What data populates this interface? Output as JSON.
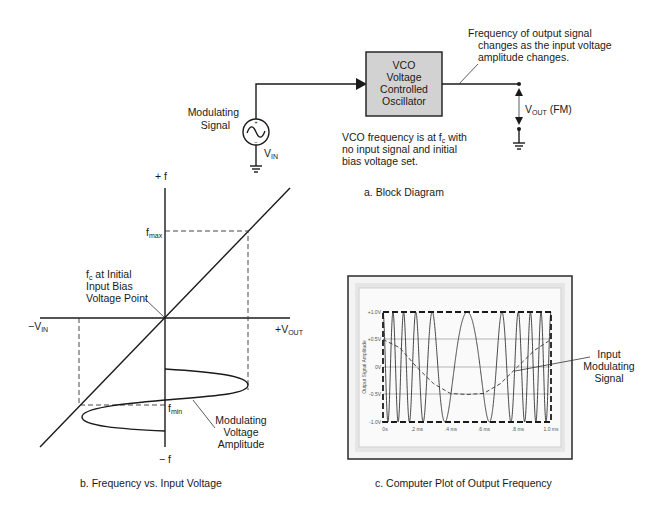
{
  "block_diagram": {
    "caption": "a. Block Diagram",
    "source_label_line1": "Modulating",
    "source_label_line2": "Signal",
    "source_name": "V",
    "source_sub": "IN",
    "vco_lines": [
      "VCO",
      "Voltage",
      "Controlled",
      "Oscillator"
    ],
    "vco_fill": "#d2d2d2",
    "output_name": "V",
    "output_sub": "OUT",
    "output_suffix": " (FM)",
    "note_top": [
      "Frequency of output signal",
      "changes as the input voltage",
      "amplitude changes."
    ],
    "note_bottom_line1_pre": "VCO frequency is at f",
    "note_bottom_line1_sub": "c",
    "note_bottom_line1_post": " with",
    "note_bottom_line2": "no input signal and initial",
    "note_bottom_line3": "bias voltage set."
  },
  "freq_graph": {
    "caption": "b. Frequency vs. Input Voltage",
    "y_pos_label": "+ f",
    "y_neg_label": "− f",
    "x_neg_label": "−V",
    "x_neg_sub": "IN",
    "x_pos_label": "+V",
    "x_pos_sub": "OUT",
    "fmax_label": "f",
    "fmax_sub": "max",
    "fmin_label": "f",
    "fmin_sub": "min",
    "fc_note_pre": "f",
    "fc_note_sub": "c",
    "fc_note_line1_post": " at Initial",
    "fc_note_line2": "Input Bias",
    "fc_note_line3": "Voltage Point",
    "mod_label": [
      "Modulating",
      "Voltage",
      "Amplitude"
    ]
  },
  "computer_plot": {
    "caption": "c. Computer Plot of Output Frequency",
    "y_axis_title": "Output Signal Amplitude",
    "y_ticks": [
      "+1.0V",
      "+0.5V",
      "0V",
      "-0.5V",
      "-1.0V"
    ],
    "x_ticks": [
      "0s",
      ".2 ms",
      ".4 ms",
      ".6 ms",
      ".8 ms",
      "1.0 ms"
    ],
    "annotation": [
      "Input",
      "Modulating",
      "Signal"
    ],
    "frame_color": "#2a2a2a",
    "panel_color": "#e9e9e9"
  },
  "chart_data": {
    "type": "line",
    "title": "Computer Plot of Output Frequency",
    "xlabel": "Time",
    "ylabel": "Output Signal Amplitude",
    "x_ticks": [
      "0s",
      ".2 ms",
      ".4 ms",
      ".6 ms",
      ".8 ms",
      "1.0 ms"
    ],
    "y_ticks": [
      "+1.0V",
      "+0.5V",
      "0V",
      "-0.5V",
      "-1.0V"
    ],
    "xlim": [
      0,
      1.0
    ],
    "ylim": [
      -1.0,
      1.0
    ],
    "grid": true,
    "series": [
      {
        "name": "FM output (VCO)",
        "description": "sinusoid amplitude 1.0V, frequency highest at 0 and 1.0 ms, lowest near 0.5 ms",
        "amplitude": 1.0,
        "cycles_approx": 10
      },
      {
        "name": "Input Modulating Signal",
        "style": "dashed",
        "x": [
          0,
          0.1,
          0.2,
          0.3,
          0.4,
          0.5,
          0.6,
          0.7,
          0.8,
          0.9,
          1.0
        ],
        "y": [
          0.5,
          0.35,
          0.0,
          -0.3,
          -0.48,
          -0.5,
          -0.48,
          -0.3,
          0.0,
          0.3,
          0.5
        ]
      }
    ]
  }
}
